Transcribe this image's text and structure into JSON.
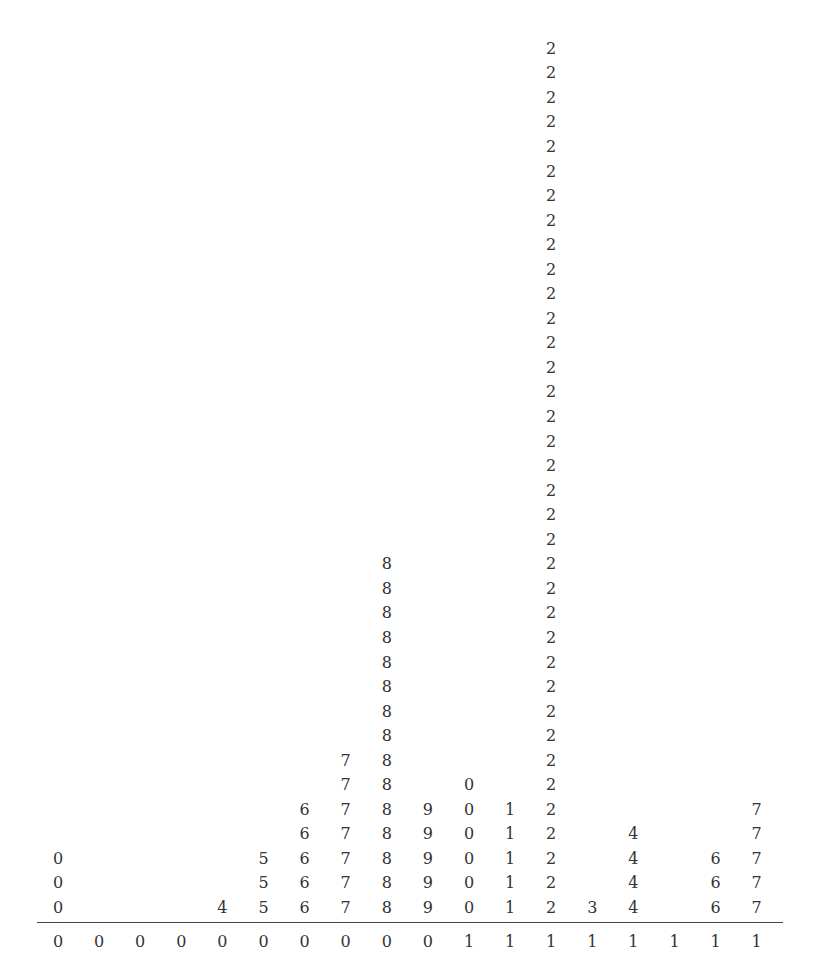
{
  "chart_data": {
    "type": "table",
    "subtype": "dot-plot (stacked leaf digits over stem/leaf axis)",
    "title": "",
    "xlabel": "",
    "ylabel": "",
    "columns": [
      {
        "stem": "0",
        "leaf": "0",
        "count": 3
      },
      {
        "stem": "0",
        "leaf": "0",
        "count": 0
      },
      {
        "stem": "0",
        "leaf": "0",
        "count": 0
      },
      {
        "stem": "0",
        "leaf": "0",
        "count": 0
      },
      {
        "stem": "0",
        "leaf": "4",
        "count": 1
      },
      {
        "stem": "0",
        "leaf": "5",
        "count": 3
      },
      {
        "stem": "0",
        "leaf": "6",
        "count": 5
      },
      {
        "stem": "0",
        "leaf": "7",
        "count": 7
      },
      {
        "stem": "0",
        "leaf": "8",
        "count": 15
      },
      {
        "stem": "0",
        "leaf": "9",
        "count": 5
      },
      {
        "stem": "1",
        "leaf": "0",
        "count": 6
      },
      {
        "stem": "1",
        "leaf": "1",
        "count": 5
      },
      {
        "stem": "1",
        "leaf": "2",
        "count": 36
      },
      {
        "stem": "1",
        "leaf": "3",
        "count": 1
      },
      {
        "stem": "1",
        "leaf": "4",
        "count": 4
      },
      {
        "stem": "1",
        "leaf": "4",
        "count": 0
      },
      {
        "stem": "1",
        "leaf": "6",
        "count": 3
      },
      {
        "stem": "1",
        "leaf": "7",
        "count": 5
      }
    ],
    "axis_labels": [
      "0",
      "0",
      "0",
      "0",
      "0",
      "0",
      "0",
      "0",
      "0",
      "0",
      "1",
      "1",
      "1",
      "1",
      "1",
      "1",
      "1",
      "1"
    ],
    "values": [
      3,
      0,
      0,
      0,
      1,
      3,
      5,
      7,
      15,
      5,
      6,
      5,
      36,
      1,
      4,
      0,
      3,
      5
    ],
    "grid": false,
    "legend": null
  },
  "layout": {
    "first_col_x": 58,
    "col_spacing": 41.1,
    "bottom_row_y": 898,
    "row_spacing": 24.55,
    "axis_label_y": 932
  }
}
